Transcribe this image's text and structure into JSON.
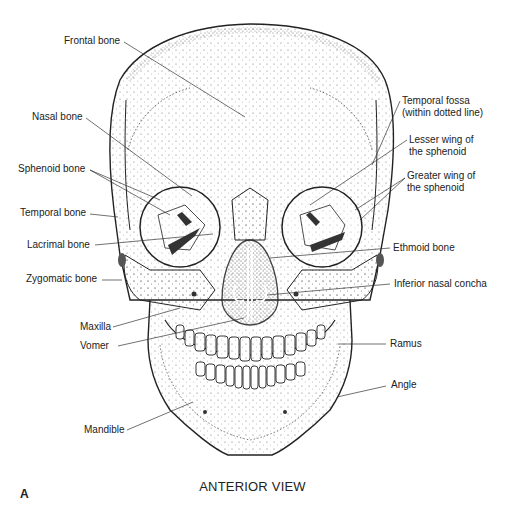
{
  "figure": {
    "panel_letter": "A",
    "caption": "ANTERIOR VIEW"
  },
  "labels": {
    "left": [
      {
        "id": "frontal-bone",
        "text": "Frontal bone"
      },
      {
        "id": "nasal-bone",
        "text": "Nasal bone"
      },
      {
        "id": "sphenoid-bone",
        "text": "Sphenoid bone"
      },
      {
        "id": "temporal-bone",
        "text": "Temporal bone"
      },
      {
        "id": "lacrimal-bone",
        "text": "Lacrimal bone"
      },
      {
        "id": "zygomatic-bone",
        "text": "Zygomatic bone"
      },
      {
        "id": "maxilla",
        "text": "Maxilla"
      },
      {
        "id": "vomer",
        "text": "Vomer"
      },
      {
        "id": "mandible",
        "text": "Mandible"
      }
    ],
    "right": [
      {
        "id": "temporal-fossa",
        "line1": "Temporal fossa",
        "line2": "(within dotted line)"
      },
      {
        "id": "lesser-wing",
        "line1": "Lesser wing of",
        "line2": "the sphenoid"
      },
      {
        "id": "greater-wing",
        "line1": "Greater wing of",
        "line2": "the sphenoid"
      },
      {
        "id": "ethmoid-bone",
        "text": "Ethmoid bone"
      },
      {
        "id": "inferior-nasal-concha",
        "text": "Inferior nasal concha"
      },
      {
        "id": "ramus",
        "text": "Ramus"
      },
      {
        "id": "angle",
        "text": "Angle"
      }
    ]
  }
}
